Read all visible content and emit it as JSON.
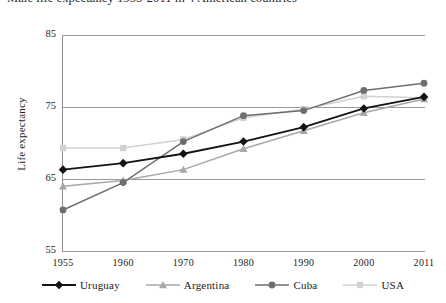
{
  "chart_data": {
    "type": "line",
    "title": "Male life expectancy 1955-2011 in 4 American countries",
    "xlabel": "",
    "ylabel": "Life expectancy",
    "categories": [
      "1955",
      "1960",
      "1970",
      "1980",
      "1990",
      "2000",
      "2011"
    ],
    "ylim": [
      55,
      85
    ],
    "yticks": [
      "55",
      "65",
      "75",
      "85"
    ],
    "grid": true,
    "legend_position": "bottom",
    "series": [
      {
        "name": "Uruguay",
        "marker": "diamond",
        "color": "#141414",
        "values": [
          66.3,
          67.2,
          68.5,
          70.2,
          72.2,
          74.8,
          76.4
        ]
      },
      {
        "name": "Argentina",
        "marker": "triangle",
        "color": "#a8a8a8",
        "values": [
          64.0,
          64.8,
          66.3,
          69.2,
          71.7,
          74.2,
          76.1
        ]
      },
      {
        "name": "Cuba",
        "marker": "circle",
        "color": "#6e6e6e",
        "values": [
          60.7,
          64.5,
          70.2,
          73.8,
          74.5,
          77.3,
          78.3
        ]
      },
      {
        "name": "USA",
        "marker": "square",
        "color": "#d2d2d2",
        "values": [
          69.3,
          69.3,
          70.5,
          73.5,
          74.7,
          76.5,
          76.3
        ]
      }
    ]
  }
}
